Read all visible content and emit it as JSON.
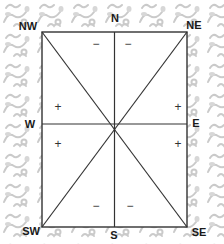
{
  "diagram": {
    "type": "vastu-direction-grid",
    "colors": {
      "background_pattern": "#c8c8c8",
      "box_fill": "#ffffff",
      "lines": "#333333",
      "labels": "#1a1a1a"
    },
    "directions": {
      "N": "N",
      "NE": "NE",
      "E": "E",
      "SE": "SE",
      "S": "S",
      "SW": "SW",
      "W": "W",
      "NW": "NW"
    },
    "zones": {
      "north_left": "−",
      "north_right": "−",
      "east_upper": "+",
      "east_lower": "+",
      "south_left": "−",
      "south_right": "−",
      "west_upper": "+",
      "west_lower": "+"
    }
  }
}
